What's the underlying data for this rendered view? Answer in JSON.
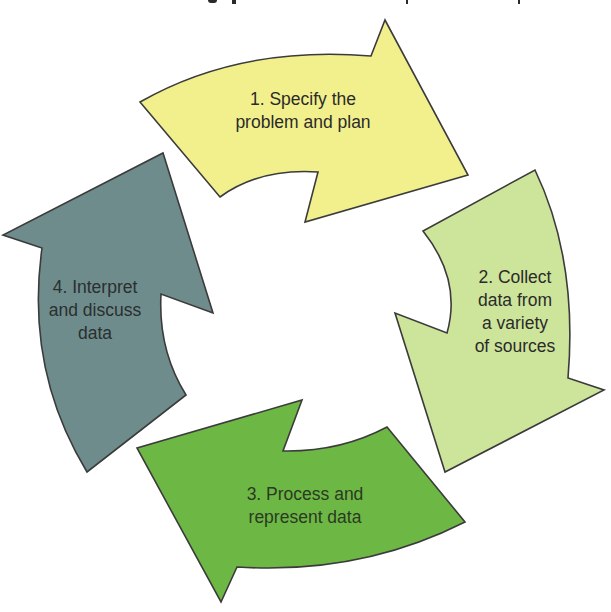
{
  "diagram": {
    "type": "cycle",
    "direction": "clockwise",
    "outline_color": "#3B3B3B",
    "steps": [
      {
        "number": 1,
        "label": "1. Specify the\nproblem and plan",
        "color": "#F2F08C",
        "position": "top"
      },
      {
        "number": 2,
        "label": "2. Collect\ndata from\na variety\nof sources",
        "color": "#CDE59A",
        "position": "right"
      },
      {
        "number": 3,
        "label": "3. Process and\nrepresent data",
        "color": "#6DB845",
        "position": "bottom"
      },
      {
        "number": 4,
        "label": "4. Interpret\nand discuss\ndata",
        "color": "#6F8C8C",
        "position": "left"
      }
    ]
  }
}
